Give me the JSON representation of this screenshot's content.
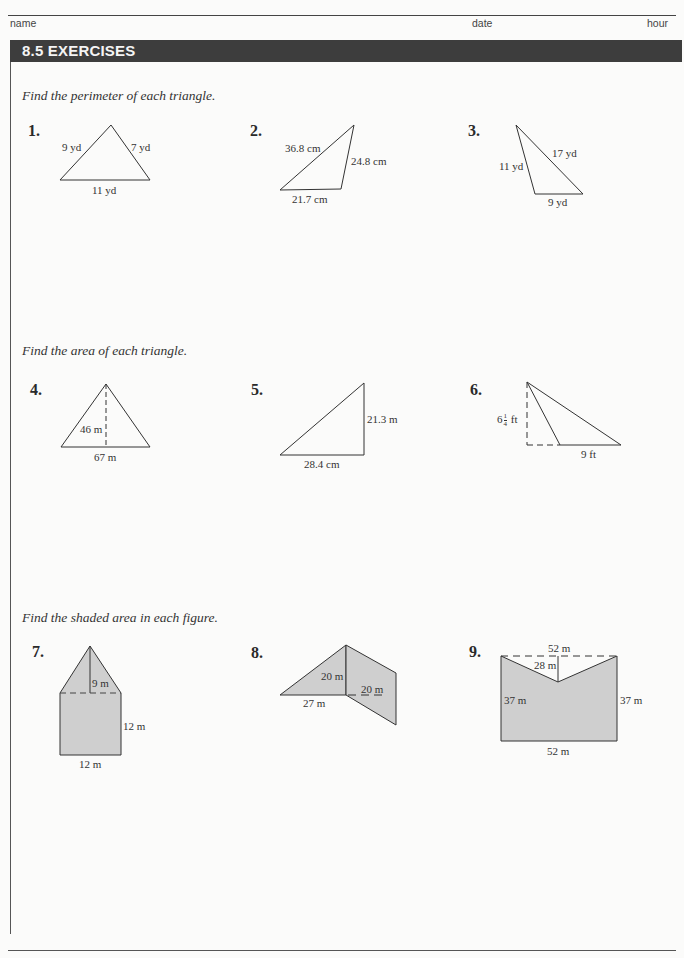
{
  "header": {
    "name_label": "name",
    "date_label": "date",
    "hour_label": "hour",
    "section_title": "8.5  EXERCISES"
  },
  "sections": [
    {
      "instruction": "Find the perimeter of each triangle.",
      "problems": [
        {
          "number": "1.",
          "labels": [
            "9 yd",
            "7 yd",
            "11 yd"
          ]
        },
        {
          "number": "2.",
          "labels": [
            "36.8 cm",
            "24.8 cm",
            "21.7 cm"
          ]
        },
        {
          "number": "3.",
          "labels": [
            "17 yd",
            "11 yd",
            "9 yd"
          ]
        }
      ]
    },
    {
      "instruction": "Find the area of each triangle.",
      "problems": [
        {
          "number": "4.",
          "labels": [
            "46 m",
            "67 m"
          ]
        },
        {
          "number": "5.",
          "labels": [
            "21.3 m",
            "28.4 cm"
          ]
        },
        {
          "number": "6.",
          "labels": [
            "6",
            "1",
            "4",
            "ft",
            "9 ft"
          ]
        }
      ]
    },
    {
      "instruction": "Find the shaded area in each figure.",
      "problems": [
        {
          "number": "7.",
          "labels": [
            "9 m",
            "12 m",
            "12 m"
          ]
        },
        {
          "number": "8.",
          "labels": [
            "20 m",
            "20 m",
            "27 m"
          ]
        },
        {
          "number": "9.",
          "labels": [
            "52 m",
            "28 m",
            "37 m",
            "37 m",
            "52 m"
          ]
        }
      ]
    }
  ],
  "colors": {
    "banner": "#3d3d3d",
    "shade": "#cfcfcf",
    "line": "#333333"
  }
}
